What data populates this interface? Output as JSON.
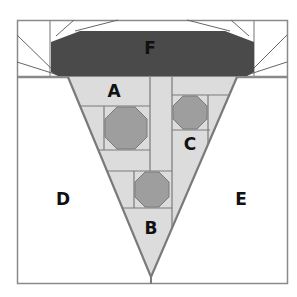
{
  "diagram": {
    "type": "quilt-block pattern",
    "labels": {
      "A": "A",
      "B": "B",
      "C": "C",
      "D": "D",
      "E": "E",
      "F": "F"
    },
    "colors": {
      "background": "#ffffff",
      "border": "#8a8a8a",
      "f_fill": "#4a4a4a",
      "triangle_fill": "#dcdcdc",
      "octagon_fill": "#9e9e9e",
      "label": "#111111"
    }
  }
}
